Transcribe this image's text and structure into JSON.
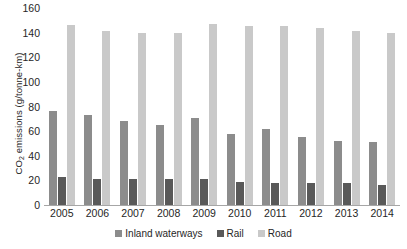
{
  "chart_data": {
    "type": "bar",
    "title": "",
    "subtitle": "",
    "xlabel": "",
    "ylabel": "CO2 emissions (g/tonne-km)",
    "ylabel_parts": {
      "prefix": "CO",
      "sub": "2",
      "suffix": " emissions (g/tonne-km)"
    },
    "categories": [
      "2005",
      "2006",
      "2007",
      "2008",
      "2009",
      "2010",
      "2011",
      "2012",
      "2013",
      "2014"
    ],
    "series": [
      {
        "name": "Inland waterways",
        "color": "#8c8c8c",
        "values": [
          76,
          73,
          68,
          65,
          71,
          58,
          62,
          55,
          52,
          51
        ]
      },
      {
        "name": "Rail",
        "color": "#595959",
        "values": [
          23,
          21,
          21,
          21,
          21,
          19,
          18,
          18,
          18,
          16
        ]
      },
      {
        "name": "Road",
        "color": "#c9c9c9",
        "values": [
          146,
          141,
          140,
          140,
          147,
          145,
          145,
          144,
          141,
          140
        ]
      }
    ],
    "ylim": [
      0,
      160
    ],
    "yticks": [
      0,
      20,
      40,
      60,
      80,
      100,
      120,
      140,
      160
    ],
    "grid": false,
    "legend_position": "bottom"
  }
}
